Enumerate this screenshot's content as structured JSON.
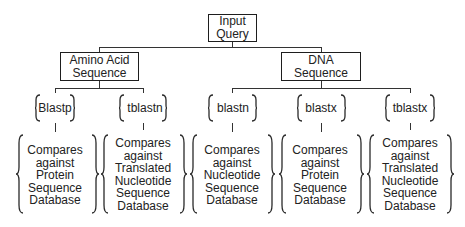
{
  "root": {
    "lines": [
      "Input",
      "Query"
    ]
  },
  "branches": [
    {
      "lines": [
        "Amino Acid",
        "Sequence"
      ],
      "programs": [
        {
          "name": "Blastp",
          "desc": [
            "Compares",
            "against",
            "Protein",
            "Sequence",
            "Database"
          ]
        },
        {
          "name": "tblastn",
          "desc": [
            "Compares",
            "against",
            "Translated",
            "Nucleotide",
            "Sequence",
            "Database"
          ]
        }
      ]
    },
    {
      "lines": [
        "DNA",
        "Sequence"
      ],
      "programs": [
        {
          "name": "blastn",
          "desc": [
            "Compares",
            "against",
            "Nucleotide",
            "Sequence",
            "Database"
          ]
        },
        {
          "name": "blastx",
          "desc": [
            "Compares",
            "against",
            "Protein",
            "Sequence",
            "Database"
          ]
        },
        {
          "name": "tblastx",
          "desc": [
            "Compares",
            "against",
            "Translated",
            "Nucleotide",
            "Sequence",
            "Database"
          ]
        }
      ]
    }
  ]
}
